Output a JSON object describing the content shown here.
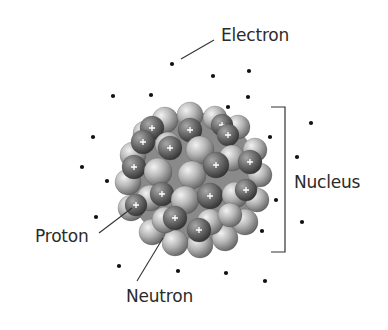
{
  "diagram": {
    "type": "atom-structure",
    "labels": {
      "electron": {
        "text": "Electron",
        "x": 221,
        "y": 27
      },
      "nucleus": {
        "text": "Nucleus",
        "x": 294,
        "y": 174
      },
      "proton": {
        "text": "Proton",
        "x": 35,
        "y": 228
      },
      "neutron": {
        "text": "Neutron",
        "x": 126,
        "y": 288
      }
    },
    "leader_lines": [
      {
        "name": "electron-leader",
        "x1": 181,
        "y1": 59,
        "x2": 214,
        "y2": 40
      },
      {
        "name": "proton-leader",
        "x1": 99,
        "y1": 233,
        "x2": 132,
        "y2": 208
      },
      {
        "name": "neutron-leader",
        "x1": 137,
        "y1": 281,
        "x2": 163,
        "y2": 238
      }
    ],
    "bracket": {
      "x": 285,
      "top": 107,
      "bottom": 252,
      "tick_left": 271
    },
    "electrons": [
      [
        172,
        64
      ],
      [
        213,
        76
      ],
      [
        249,
        71
      ],
      [
        248,
        97
      ],
      [
        228,
        107
      ],
      [
        113,
        96
      ],
      [
        151,
        95
      ],
      [
        93,
        137
      ],
      [
        82,
        167
      ],
      [
        107,
        181
      ],
      [
        96,
        217
      ],
      [
        311,
        123
      ],
      [
        270,
        137
      ],
      [
        297,
        157
      ],
      [
        276,
        200
      ],
      [
        302,
        222
      ],
      [
        262,
        231
      ],
      [
        119,
        266
      ],
      [
        178,
        271
      ],
      [
        226,
        273
      ],
      [
        265,
        281
      ]
    ],
    "nucleus_center": [
      193,
      178
    ],
    "nucleus_radius": 70,
    "colors": {
      "electron": "#111111",
      "line": "#333333",
      "proton_dark": "#4a4a4a",
      "proton_light": "#9a9a9a",
      "neutron_dark": "#6e6e6e",
      "neutron_light": "#dcdcdc",
      "plus": "#ffffff"
    },
    "particles": [
      {
        "x": 165,
        "y": 120,
        "r": 13,
        "kind": "n"
      },
      {
        "x": 190,
        "y": 115,
        "r": 13,
        "kind": "n"
      },
      {
        "x": 215,
        "y": 118,
        "r": 12,
        "kind": "n"
      },
      {
        "x": 238,
        "y": 127,
        "r": 12,
        "kind": "n"
      },
      {
        "x": 145,
        "y": 133,
        "r": 12,
        "kind": "n"
      },
      {
        "x": 133,
        "y": 155,
        "r": 13,
        "kind": "n"
      },
      {
        "x": 128,
        "y": 182,
        "r": 13,
        "kind": "n"
      },
      {
        "x": 131,
        "y": 208,
        "r": 13,
        "kind": "n"
      },
      {
        "x": 255,
        "y": 150,
        "r": 12,
        "kind": "n"
      },
      {
        "x": 260,
        "y": 175,
        "r": 12,
        "kind": "n"
      },
      {
        "x": 257,
        "y": 200,
        "r": 12,
        "kind": "n"
      },
      {
        "x": 245,
        "y": 222,
        "r": 13,
        "kind": "n"
      },
      {
        "x": 225,
        "y": 238,
        "r": 13,
        "kind": "n"
      },
      {
        "x": 200,
        "y": 245,
        "r": 13,
        "kind": "n"
      },
      {
        "x": 175,
        "y": 243,
        "r": 13,
        "kind": "n"
      },
      {
        "x": 152,
        "y": 232,
        "r": 13,
        "kind": "n"
      },
      {
        "x": 152,
        "y": 128,
        "r": 12,
        "kind": "p",
        "plus": true
      },
      {
        "x": 190,
        "y": 130,
        "r": 12,
        "kind": "p",
        "plus": true
      },
      {
        "x": 222,
        "y": 125,
        "r": 11,
        "kind": "p",
        "plus": true
      },
      {
        "x": 143,
        "y": 142,
        "r": 12,
        "kind": "p",
        "plus": true
      },
      {
        "x": 228,
        "y": 135,
        "r": 11,
        "kind": "p",
        "plus": true
      },
      {
        "x": 168,
        "y": 145,
        "r": 13,
        "kind": "n"
      },
      {
        "x": 200,
        "y": 150,
        "r": 14,
        "kind": "n"
      },
      {
        "x": 232,
        "y": 158,
        "r": 13,
        "kind": "n"
      },
      {
        "x": 170,
        "y": 148,
        "r": 12,
        "kind": "p",
        "plus": true
      },
      {
        "x": 134,
        "y": 167,
        "r": 12,
        "kind": "p",
        "plus": true
      },
      {
        "x": 158,
        "y": 172,
        "r": 14,
        "kind": "n"
      },
      {
        "x": 192,
        "y": 175,
        "r": 14,
        "kind": "n"
      },
      {
        "x": 216,
        "y": 165,
        "r": 13,
        "kind": "p",
        "plus": true
      },
      {
        "x": 250,
        "y": 162,
        "r": 12,
        "kind": "p",
        "plus": true
      },
      {
        "x": 150,
        "y": 198,
        "r": 13,
        "kind": "n"
      },
      {
        "x": 162,
        "y": 194,
        "r": 12,
        "kind": "p",
        "plus": true
      },
      {
        "x": 185,
        "y": 200,
        "r": 14,
        "kind": "n"
      },
      {
        "x": 210,
        "y": 196,
        "r": 13,
        "kind": "p",
        "plus": true
      },
      {
        "x": 235,
        "y": 195,
        "r": 13,
        "kind": "n"
      },
      {
        "x": 246,
        "y": 190,
        "r": 11,
        "kind": "p",
        "plus": true
      },
      {
        "x": 136,
        "y": 205,
        "r": 11,
        "kind": "p",
        "plus": true
      },
      {
        "x": 165,
        "y": 220,
        "r": 13,
        "kind": "n"
      },
      {
        "x": 175,
        "y": 218,
        "r": 12,
        "kind": "p",
        "plus": true
      },
      {
        "x": 210,
        "y": 222,
        "r": 13,
        "kind": "n"
      },
      {
        "x": 199,
        "y": 230,
        "r": 12,
        "kind": "p",
        "plus": true
      },
      {
        "x": 230,
        "y": 215,
        "r": 12,
        "kind": "n"
      }
    ]
  }
}
